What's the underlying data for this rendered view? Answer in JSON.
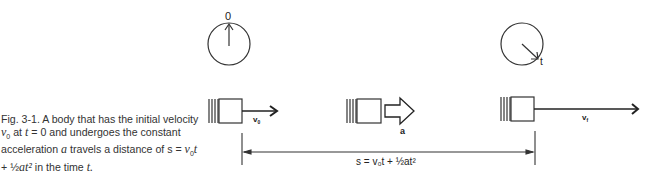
{
  "caption": {
    "fig_label": "Fig. 3-1.",
    "text_1": "A body that has the initial velocity",
    "v0": "v",
    "v0_sub": "0",
    "text_2": "at",
    "t_var": "t",
    "text_3": "= 0 and undergoes the constant acceleration",
    "a_var": "a",
    "text_4": "travels a distance of s =",
    "formula_v0t": "v",
    "formula_sub": "0",
    "formula_t": "t",
    "formula_plus": "+ ½",
    "formula_at2": "at²",
    "text_5": "in the time",
    "text_end": "t."
  },
  "diagram": {
    "clock_start_label": "0",
    "clock_end_label": "t",
    "v0_label": "v",
    "v0_sub": "0",
    "accel_label": "a",
    "vf_label": "v",
    "vf_sub": "f",
    "distance_formula": "s = v₀t + ½at²"
  }
}
